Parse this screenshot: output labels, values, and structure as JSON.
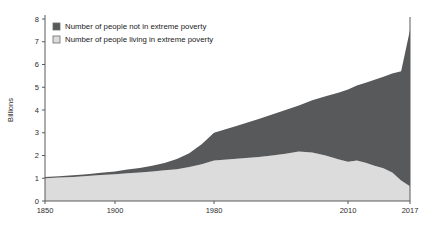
{
  "chart_data": {
    "type": "area",
    "stacked": true,
    "title": "",
    "subtitle": "",
    "xlabel": "",
    "ylabel": "Billions",
    "ylim": [
      0,
      8
    ],
    "xlim": [
      1850,
      2017
    ],
    "grid": false,
    "legend_position": "top-left",
    "y_ticks": [
      "0",
      "1",
      "2",
      "3",
      "4",
      "5",
      "6",
      "7",
      "8"
    ],
    "x_ticks": [
      "1850",
      "1900",
      "1980",
      "2010",
      "2017"
    ],
    "x_tick_positions_px": [
      45,
      115,
      214,
      348,
      410
    ],
    "series": [
      {
        "name": "Number of people living in extreme poverty",
        "color": "#dcdcdc",
        "stack_order": 0,
        "x": [
          1850,
          1860,
          1870,
          1880,
          1890,
          1900,
          1910,
          1920,
          1930,
          1940,
          1950,
          1960,
          1970,
          1980,
          1985,
          1990,
          1993,
          1996,
          1999,
          2002,
          2005,
          2008,
          2010,
          2011,
          2012,
          2013,
          2014,
          2015,
          2016,
          2017
        ],
        "values": [
          1.0,
          1.03,
          1.06,
          1.1,
          1.14,
          1.18,
          1.22,
          1.25,
          1.3,
          1.35,
          1.4,
          1.5,
          1.62,
          1.78,
          1.86,
          1.93,
          2.0,
          2.08,
          2.18,
          2.13,
          2.0,
          1.82,
          1.72,
          1.78,
          1.68,
          1.55,
          1.44,
          1.25,
          0.9,
          0.65
        ]
      },
      {
        "name": "Number of people not in extreme poverty",
        "color": "#58595b",
        "stack_order": 1,
        "x": [
          1850,
          1860,
          1870,
          1880,
          1890,
          1900,
          1910,
          1920,
          1930,
          1940,
          1950,
          1960,
          1970,
          1980,
          1985,
          1990,
          1993,
          1996,
          1999,
          2002,
          2005,
          2008,
          2010,
          2011,
          2012,
          2013,
          2014,
          2015,
          2016,
          2017
        ],
        "values": [
          0.05,
          0.06,
          0.07,
          0.08,
          0.1,
          0.12,
          0.16,
          0.2,
          0.25,
          0.32,
          0.45,
          0.6,
          0.88,
          1.22,
          1.44,
          1.67,
          1.8,
          1.92,
          2.02,
          2.3,
          2.6,
          2.95,
          3.18,
          3.3,
          3.52,
          3.78,
          4.02,
          4.35,
          4.8,
          6.87
        ]
      }
    ],
    "totals": {
      "comment_free": "stacked totals (world population) in billions",
      "x": [
        1850,
        1860,
        1870,
        1880,
        1890,
        1900,
        1910,
        1920,
        1930,
        1940,
        1950,
        1960,
        1970,
        1980,
        1985,
        1990,
        1993,
        1996,
        1999,
        2002,
        2005,
        2008,
        2010,
        2011,
        2012,
        2013,
        2014,
        2015,
        2016,
        2017
      ],
      "values": [
        1.05,
        1.09,
        1.13,
        1.18,
        1.24,
        1.3,
        1.38,
        1.45,
        1.55,
        1.67,
        1.85,
        2.1,
        2.5,
        3.0,
        3.3,
        3.6,
        3.8,
        4.0,
        4.2,
        4.43,
        4.6,
        4.77,
        4.9,
        5.08,
        5.2,
        5.33,
        5.46,
        5.6,
        5.7,
        7.52
      ]
    }
  },
  "legend": {
    "items": [
      {
        "label": "Number of people not in extreme poverty",
        "swatch_color": "#58595b"
      },
      {
        "label": "Number of people living in extreme poverty",
        "swatch_color": "#dcdcdc"
      }
    ]
  },
  "axes": {
    "y_title": "Billions"
  }
}
